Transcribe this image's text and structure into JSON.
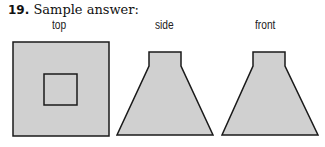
{
  "problem": {
    "number": "19.",
    "title": "Sample answer:"
  },
  "views": [
    {
      "label": "top"
    },
    {
      "label": "side"
    },
    {
      "label": "front"
    }
  ],
  "colors": {
    "fill": "#d0d0d0",
    "stroke": "#1a1a1a"
  }
}
